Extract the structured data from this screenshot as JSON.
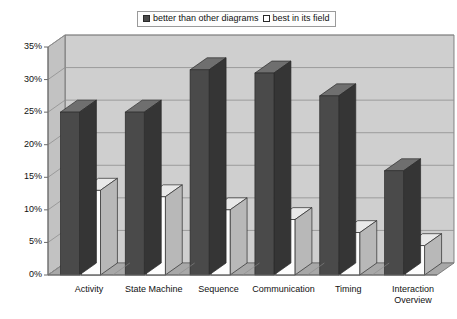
{
  "title_remnant": "",
  "legend": {
    "items": [
      {
        "label": "better than other diagrams",
        "swatch": "dark-swatch-icon",
        "color": "#4a4a4a"
      },
      {
        "label": "best in its field",
        "swatch": "light-swatch-icon",
        "color": "#ffffff"
      }
    ]
  },
  "axes": {
    "y_ticks": [
      "0%",
      "5%",
      "10%",
      "15%",
      "20%",
      "25%",
      "30%",
      "35%"
    ],
    "x_ticks": [
      "Activity",
      "State Machine",
      "Sequence",
      "Communication",
      "Timing",
      "Interaction Overview"
    ]
  },
  "colors": {
    "series_dark": "#4a4a4a",
    "series_dark_top": "#6f6f6f",
    "series_dark_side": "#353535",
    "series_light": "#fdfdfd",
    "series_light_top": "#e9e9e9",
    "series_light_side": "#b8b8b8",
    "plot_back": "#cfcfcf",
    "plot_side": "#c2c2c2",
    "plot_floor": "#a8a8a8",
    "gridline": "#8f8f8f",
    "axis_line": "#6b6b6b"
  },
  "chart_data": {
    "type": "bar",
    "title": "",
    "subtitle": "",
    "xlabel": "",
    "ylabel": "",
    "ylim": [
      0,
      35
    ],
    "ytick_values": [
      0,
      5,
      10,
      15,
      20,
      25,
      30,
      35
    ],
    "ytick_labels": [
      "0%",
      "5%",
      "10%",
      "15%",
      "20%",
      "25%",
      "30%",
      "35%"
    ],
    "grid": true,
    "legend_position": "top-center",
    "style": "3d-clustered-column",
    "categories": [
      "Activity",
      "State Machine",
      "Sequence",
      "Communication",
      "Timing",
      "Interaction Overview"
    ],
    "series": [
      {
        "name": "better than other diagrams",
        "color": "#4a4a4a",
        "values": [
          25,
          25,
          31.5,
          31,
          27.5,
          16
        ]
      },
      {
        "name": "best in its field",
        "color": "#ffffff",
        "values": [
          13,
          12,
          10,
          8.5,
          6.5,
          4.5
        ]
      }
    ],
    "units": "percent",
    "annotations": []
  }
}
